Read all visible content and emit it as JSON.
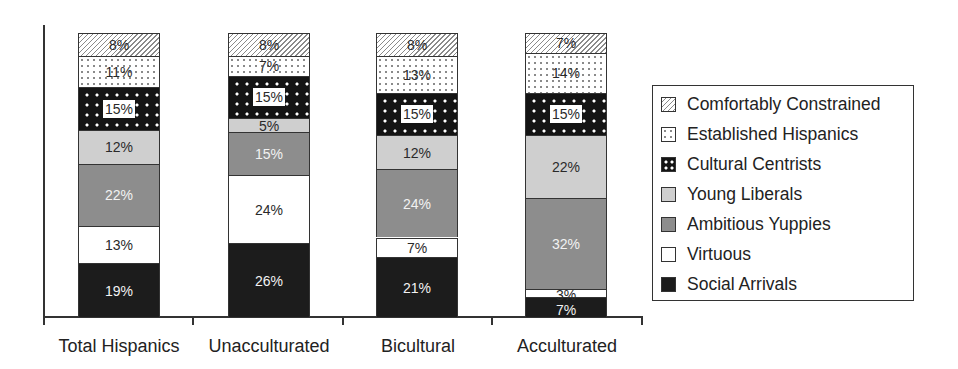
{
  "chart_data": {
    "type": "bar",
    "stacked": true,
    "percent": true,
    "title": "",
    "xlabel": "",
    "ylabel": "",
    "ylim": [
      0,
      100
    ],
    "grid": false,
    "legend_position": "right",
    "categories": [
      "Total Hispanics",
      "Unacculturated",
      "Bicultural",
      "Acculturated"
    ],
    "series": [
      {
        "name": "Social Arrivals",
        "key": "social",
        "values": [
          19,
          26,
          21,
          7
        ]
      },
      {
        "name": "Virtuous",
        "key": "virtuous",
        "values": [
          13,
          24,
          7,
          3
        ]
      },
      {
        "name": "Ambitious Yuppies",
        "key": "ambitious",
        "values": [
          22,
          15,
          24,
          32
        ]
      },
      {
        "name": "Young Liberals",
        "key": "young",
        "values": [
          12,
          5,
          12,
          22
        ]
      },
      {
        "name": "Cultural Centrists",
        "key": "cultural",
        "values": [
          15,
          15,
          15,
          15
        ]
      },
      {
        "name": "Established Hispanics",
        "key": "established",
        "values": [
          11,
          7,
          13,
          14
        ]
      },
      {
        "name": "Comfortably Constrained",
        "key": "comfortably",
        "values": [
          8,
          8,
          8,
          7
        ]
      }
    ],
    "legend_order": [
      "Comfortably Constrained",
      "Established Hispanics",
      "Cultural Centrists",
      "Young Liberals",
      "Ambitious Yuppies",
      "Virtuous",
      "Social Arrivals"
    ],
    "label_format": "{v}%"
  },
  "legend": {
    "items": [
      {
        "label": "Comfortably Constrained",
        "key": "comfortably",
        "icon": "diagonal-hatch-swatch"
      },
      {
        "label": "Established Hispanics",
        "key": "established",
        "icon": "light-dots-swatch"
      },
      {
        "label": "Cultural Centrists",
        "key": "cultural",
        "icon": "black-dots-swatch"
      },
      {
        "label": "Young Liberals",
        "key": "young",
        "icon": "light-gray-swatch"
      },
      {
        "label": "Ambitious Yuppies",
        "key": "ambitious",
        "icon": "dark-gray-swatch"
      },
      {
        "label": "Virtuous",
        "key": "virtuous",
        "icon": "white-swatch"
      },
      {
        "label": "Social Arrivals",
        "key": "social",
        "icon": "black-swatch"
      }
    ]
  },
  "colors": {
    "young": "#cfcfcf",
    "ambitious": "#8d8d8d",
    "social": "#1c1c1c",
    "cultural": "#141414",
    "virtuous": "#ffffff",
    "axis": "#333333"
  }
}
